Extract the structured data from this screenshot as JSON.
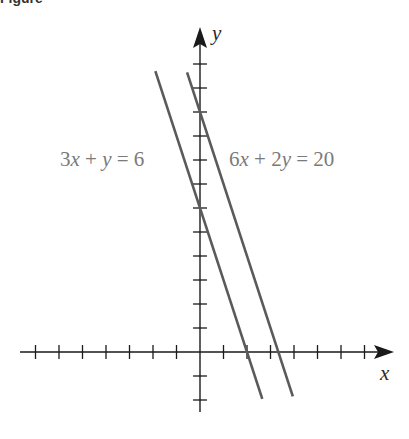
{
  "figure": {
    "header_partial": "Figure"
  },
  "chart_data": {
    "type": "line",
    "title": "",
    "xlabel": "x",
    "ylabel": "y",
    "xlim": [
      -8,
      8
    ],
    "ylim": [
      -3,
      13.5
    ],
    "x_ticks": [
      -7,
      -6,
      -5,
      -4,
      -3,
      -2,
      -1,
      1,
      2,
      3,
      4,
      5,
      6,
      7
    ],
    "y_ticks": [
      -2,
      -1,
      1,
      2,
      3,
      4,
      5,
      6,
      7,
      8,
      9,
      10,
      11,
      12
    ],
    "tick_labels_shown": false,
    "grid": false,
    "series": [
      {
        "name": "3x + y = 6",
        "equation": "y = 6 - 3x",
        "slope": -3,
        "y_intercept": 6,
        "x_intercept": 2,
        "x": [
          -1.9,
          2.65
        ],
        "y": [
          11.7,
          -1.95
        ]
      },
      {
        "name": "6x + 2y = 20",
        "equation": "y = 10 - 3x",
        "slope": -3,
        "y_intercept": 10,
        "x_intercept": 3.333,
        "x": [
          -0.55,
          3.95
        ],
        "y": [
          11.65,
          -1.85
        ]
      }
    ],
    "annotations": [
      {
        "text": "3x + y = 6",
        "position": "left of y-axis, near y=8"
      },
      {
        "text": "6x + 2y = 20",
        "position": "right of y-axis, near y=8"
      }
    ],
    "note": "Two parallel lines (same slope -3), system has no solution"
  },
  "labels": {
    "eq1": {
      "a": "3",
      "v1": "x",
      "op": " + ",
      "v2": "y",
      "rhs": " = 6"
    },
    "eq2": {
      "a": "6",
      "v1": "x",
      "op": " + 2",
      "v2": "y",
      "rhs": " = 20"
    },
    "x_axis": "x",
    "y_axis": "y"
  },
  "colors": {
    "axis": "#1a1a1a",
    "line": "#5a5a5a",
    "label": "#7a7a7a"
  }
}
